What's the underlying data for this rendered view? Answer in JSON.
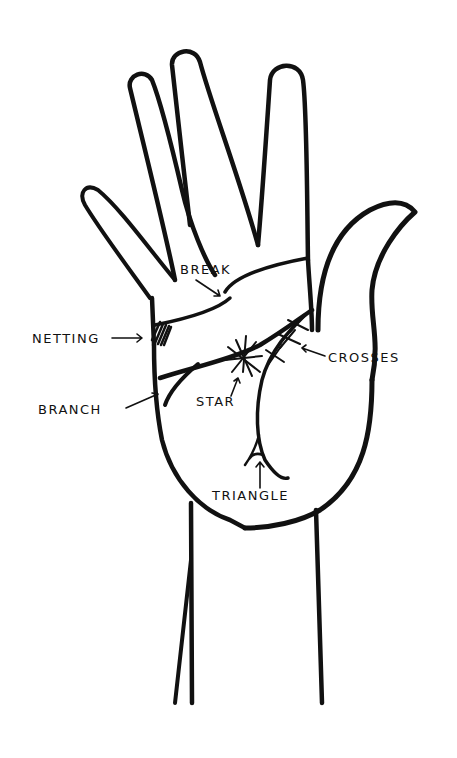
{
  "diagram": {
    "colors": {
      "background": "#ffffff",
      "ink": "#111111"
    },
    "labels": [
      {
        "id": "break",
        "text": "BREAK"
      },
      {
        "id": "netting",
        "text": "NETTING"
      },
      {
        "id": "branch",
        "text": "BRANCH"
      },
      {
        "id": "star",
        "text": "STAR"
      },
      {
        "id": "crosses",
        "text": "CROSSES"
      },
      {
        "id": "triangle",
        "text": "TRIANGLE"
      }
    ]
  }
}
